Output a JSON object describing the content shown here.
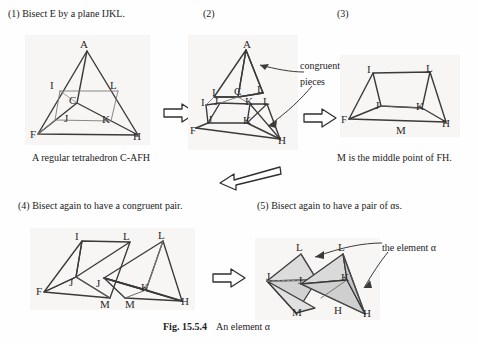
{
  "figure": {
    "caption_number": "Fig. 15.5.4",
    "caption_text": "An element  α"
  },
  "steps": [
    {
      "id": "step1",
      "label": "(1) Bisect E by a plane IJKL."
    },
    {
      "id": "step2",
      "label": "(2)"
    },
    {
      "id": "step3",
      "label": "(3)"
    },
    {
      "id": "step4",
      "label": "(4) Bisect again to have a congruent pair."
    },
    {
      "id": "step5",
      "label": "(5) Bisect again to have a pair of αs."
    }
  ],
  "notes": {
    "tetrahedron_note": "A regular tetrahedron C-AFH",
    "midpoint_note": "M is the middle point of FH.",
    "congruent_line1": "congruent",
    "congruent_line2": "pieces",
    "element_alpha": "the element α"
  },
  "diagrams": {
    "d1": {
      "name": "regular-tetrahedron-C-AFH",
      "vertices": [
        {
          "label": "A",
          "x": 83,
          "y": 47
        },
        {
          "label": "I",
          "x": 56,
          "y": 86
        },
        {
          "label": "L",
          "x": 112,
          "y": 86
        },
        {
          "label": "C",
          "x": 73,
          "y": 101
        },
        {
          "label": "J",
          "x": 69,
          "y": 119
        },
        {
          "label": "K",
          "x": 105,
          "y": 120
        },
        {
          "label": "F",
          "x": 36,
          "y": 132
        },
        {
          "label": "H",
          "x": 135,
          "y": 134
        }
      ]
    },
    "d2": {
      "name": "bisected-tetrahedron-congruent-pieces",
      "vertices": [
        {
          "label": "A",
          "x": 246,
          "y": 47
        },
        {
          "label": "I",
          "x": 216,
          "y": 92
        },
        {
          "label": "C",
          "x": 238,
          "y": 92
        },
        {
          "label": "L",
          "x": 260,
          "y": 90
        },
        {
          "label": "I",
          "x": 206,
          "y": 103
        },
        {
          "label": "J",
          "x": 219,
          "y": 101
        },
        {
          "label": "K",
          "x": 249,
          "y": 102
        },
        {
          "label": "L",
          "x": 266,
          "y": 102
        },
        {
          "label": "J",
          "x": 212,
          "y": 120
        },
        {
          "label": "K",
          "x": 247,
          "y": 121
        },
        {
          "label": "F",
          "x": 196,
          "y": 128
        },
        {
          "label": "H",
          "x": 280,
          "y": 139
        }
      ]
    },
    "d3": {
      "name": "prism-wedge-FIJKLM",
      "vertices": [
        {
          "label": "I",
          "x": 370,
          "y": 70
        },
        {
          "label": "L",
          "x": 428,
          "y": 69
        },
        {
          "label": "J",
          "x": 378,
          "y": 105
        },
        {
          "label": "K",
          "x": 419,
          "y": 106
        },
        {
          "label": "F",
          "x": 348,
          "y": 117
        },
        {
          "label": "M",
          "x": 399,
          "y": 130
        },
        {
          "label": "H",
          "x": 444,
          "y": 122
        }
      ]
    },
    "d4": {
      "name": "congruent-pair-pieces",
      "vertices": [
        {
          "label": "I",
          "x": 78,
          "y": 237
        },
        {
          "label": "L",
          "x": 125,
          "y": 237
        },
        {
          "label": "L",
          "x": 160,
          "y": 236
        },
        {
          "label": "J",
          "x": 73,
          "y": 283
        },
        {
          "label": "J",
          "x": 99,
          "y": 284
        },
        {
          "label": "K",
          "x": 144,
          "y": 288
        },
        {
          "label": "F",
          "x": 42,
          "y": 290
        },
        {
          "label": "M",
          "x": 103,
          "y": 304
        },
        {
          "label": "M",
          "x": 128,
          "y": 304
        },
        {
          "label": "H",
          "x": 183,
          "y": 301
        }
      ]
    },
    "d5": {
      "name": "pair-of-alpha-elements",
      "vertices": [
        {
          "label": "L",
          "x": 298,
          "y": 248
        },
        {
          "label": "L",
          "x": 340,
          "y": 248
        },
        {
          "label": "J",
          "x": 270,
          "y": 277
        },
        {
          "label": "J",
          "x": 301,
          "y": 281
        },
        {
          "label": "K",
          "x": 344,
          "y": 278
        },
        {
          "label": "M",
          "x": 296,
          "y": 312
        },
        {
          "label": "H",
          "x": 337,
          "y": 310
        },
        {
          "label": "H",
          "x": 366,
          "y": 313
        }
      ]
    }
  },
  "arrows": [
    {
      "id": "arrow-1-to-2",
      "direction": "right"
    },
    {
      "id": "arrow-2-to-3",
      "direction": "right"
    },
    {
      "id": "arrow-row1-to-row2",
      "direction": "left-down"
    },
    {
      "id": "arrow-4-to-5",
      "direction": "right"
    },
    {
      "id": "pointer-congruent-upper",
      "direction": "curve-left"
    },
    {
      "id": "pointer-congruent-lower",
      "direction": "curve-left-down"
    },
    {
      "id": "pointer-alpha-left",
      "direction": "curve-left"
    },
    {
      "id": "pointer-alpha-right",
      "direction": "curve-down"
    }
  ],
  "colors": {
    "ink": "#2a2a2a",
    "panel_bg": "#f7f6f4",
    "shade_fill": "#d6d6d6",
    "shade_fill_light": "#e4e4e4"
  }
}
